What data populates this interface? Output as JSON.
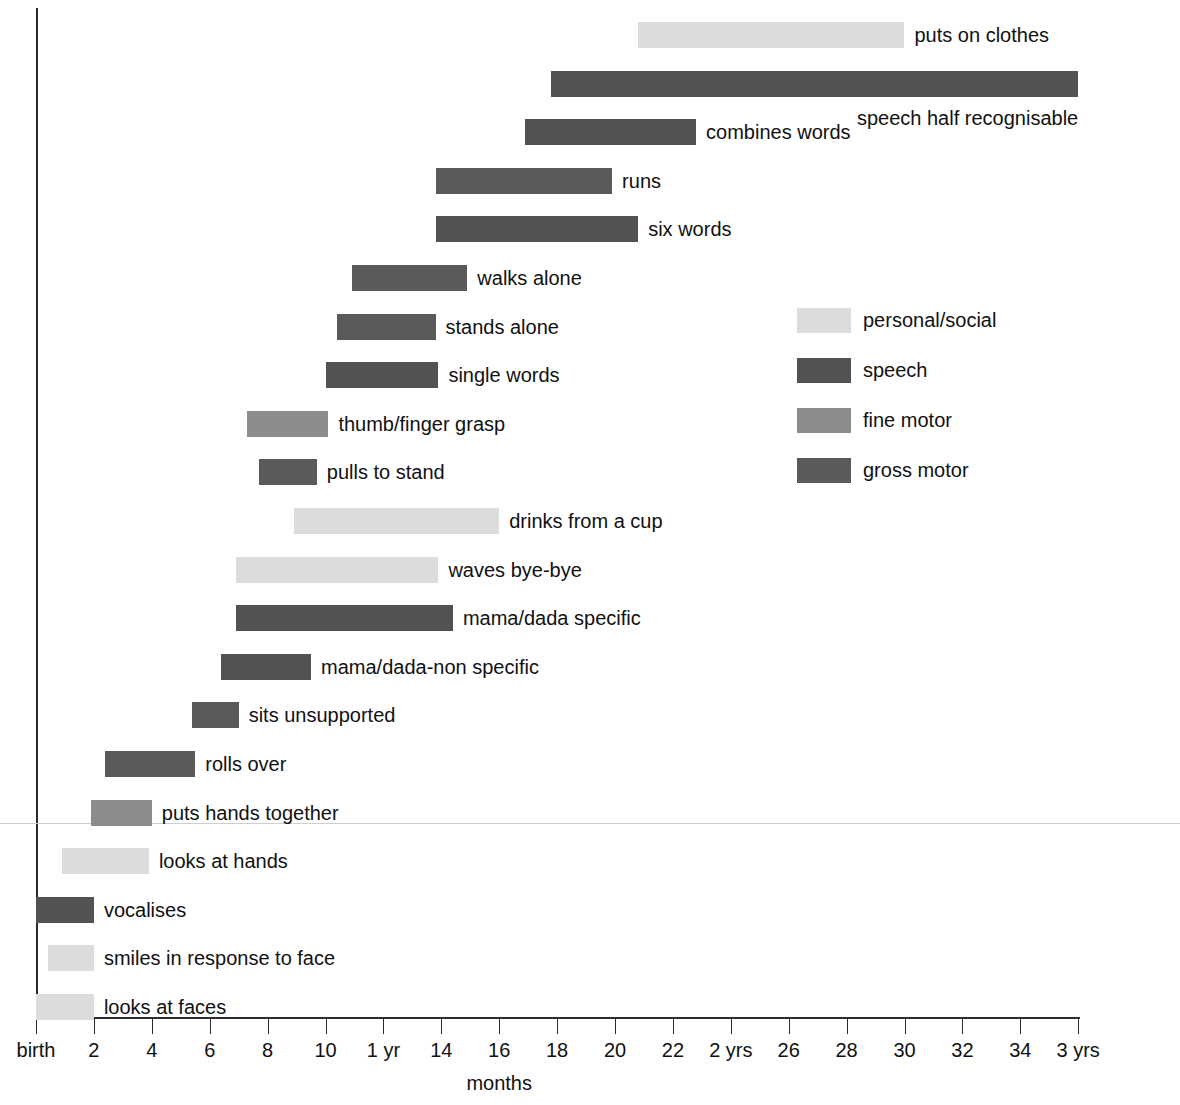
{
  "chart_data": {
    "type": "bar",
    "subtype": "horizontal-range-bar",
    "title": "",
    "xlabel": "months",
    "ylabel": "",
    "xlim": [
      0,
      36
    ],
    "grid": false,
    "legend_position": "middle-right",
    "x_tick_values": [
      0,
      2,
      4,
      6,
      8,
      10,
      12,
      14,
      16,
      18,
      20,
      22,
      24,
      26,
      28,
      30,
      32,
      34,
      36
    ],
    "x_tick_labels": [
      "birth",
      "2",
      "4",
      "6",
      "8",
      "10",
      "1 yr",
      "14",
      "16",
      "18",
      "20",
      "22",
      "2 yrs",
      "26",
      "28",
      "30",
      "32",
      "34",
      "3 yrs"
    ],
    "categories": [
      "personal/social",
      "speech",
      "fine motor",
      "gross motor"
    ],
    "category_colors": {
      "personal/social": "#dcdcdc",
      "speech": "#525252",
      "fine motor": "#8c8c8c",
      "gross motor": "#5a5a5a"
    },
    "bars": [
      {
        "label": "puts on clothes",
        "category": "personal/social",
        "start_months": 20.8,
        "end_months": 30.0
      },
      {
        "label": "speech half recognisable",
        "category": "speech",
        "start_months": 17.8,
        "end_months": 36.0
      },
      {
        "label": "combines words",
        "category": "speech",
        "start_months": 16.9,
        "end_months": 22.8
      },
      {
        "label": "runs",
        "category": "gross motor",
        "start_months": 13.8,
        "end_months": 19.9
      },
      {
        "label": "six words",
        "category": "speech",
        "start_months": 13.8,
        "end_months": 20.8
      },
      {
        "label": "walks alone",
        "category": "gross motor",
        "start_months": 10.9,
        "end_months": 14.9
      },
      {
        "label": "stands alone",
        "category": "gross motor",
        "start_months": 10.4,
        "end_months": 13.8
      },
      {
        "label": "single words",
        "category": "speech",
        "start_months": 10.0,
        "end_months": 13.9
      },
      {
        "label": "thumb/finger grasp",
        "category": "fine motor",
        "start_months": 7.3,
        "end_months": 10.1
      },
      {
        "label": "pulls to stand",
        "category": "gross motor",
        "start_months": 7.7,
        "end_months": 9.7
      },
      {
        "label": "drinks from a cup",
        "category": "personal/social",
        "start_months": 8.9,
        "end_months": 16.0
      },
      {
        "label": "waves bye-bye",
        "category": "personal/social",
        "start_months": 6.9,
        "end_months": 13.9
      },
      {
        "label": "mama/dada specific",
        "category": "speech",
        "start_months": 6.9,
        "end_months": 14.4
      },
      {
        "label": "mama/dada-non specific",
        "category": "speech",
        "start_months": 6.4,
        "end_months": 9.5
      },
      {
        "label": "sits unsupported",
        "category": "gross motor",
        "start_months": 5.4,
        "end_months": 7.0
      },
      {
        "label": "rolls over",
        "category": "gross motor",
        "start_months": 2.4,
        "end_months": 5.5
      },
      {
        "label": "puts hands together",
        "category": "fine motor",
        "start_months": 1.9,
        "end_months": 4.0
      },
      {
        "label": "looks at hands",
        "category": "personal/social",
        "start_months": 0.9,
        "end_months": 3.9
      },
      {
        "label": "vocalises",
        "category": "speech",
        "start_months": 0.0,
        "end_months": 2.0
      },
      {
        "label": "smiles in response to face",
        "category": "personal/social",
        "start_months": 0.4,
        "end_months": 2.0
      },
      {
        "label": "looks at faces",
        "category": "personal/social",
        "start_months": 0.0,
        "end_months": 2.0
      }
    ]
  },
  "axis": {
    "x_title": "months"
  },
  "legend": {
    "items": [
      {
        "label": "personal/social",
        "color": "#dcdcdc"
      },
      {
        "label": "speech",
        "color": "#525252"
      },
      {
        "label": "fine motor",
        "color": "#8c8c8c"
      },
      {
        "label": "gross motor",
        "color": "#5a5a5a"
      }
    ]
  }
}
